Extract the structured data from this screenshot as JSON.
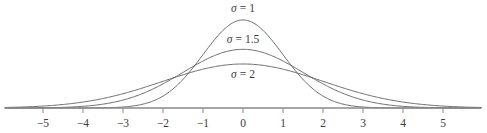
{
  "chart_data": {
    "type": "line",
    "title": "",
    "subtitle": "",
    "xlabel": "",
    "ylabel": "",
    "xlim": [
      -5.95,
      5.95
    ],
    "ylim": [
      0,
      0.4
    ],
    "grid": false,
    "legend_position": "inline-annotations",
    "x_ticks": [
      -5,
      -4,
      -3,
      -2,
      -1,
      0,
      1,
      2,
      3,
      4,
      5
    ],
    "x_tick_labels": [
      "−5",
      "−4",
      "−3",
      "−2",
      "−1",
      "0",
      "1",
      "2",
      "3",
      "4",
      "5"
    ],
    "y_ticks": [],
    "y_tick_labels": [],
    "series": [
      {
        "name": "σ = 1",
        "sigma": 1,
        "mu": 0,
        "peak_value": 0.3989,
        "annotation": {
          "symbol": "σ",
          "equals": "=",
          "value": "1",
          "x": 0,
          "y_px": 12
        },
        "x": [
          -5.95,
          -5.5,
          -5,
          -4.5,
          -4,
          -3.5,
          -3,
          -2.5,
          -2,
          -1.5,
          -1,
          -0.5,
          0,
          0.5,
          1,
          1.5,
          2,
          2.5,
          3,
          3.5,
          4,
          4.5,
          5,
          5.5,
          5.95
        ],
        "values": [
          0.0,
          0.0001,
          0.0,
          0.0,
          0.0001,
          0.0009,
          0.0044,
          0.0175,
          0.054,
          0.1295,
          0.242,
          0.3521,
          0.3989,
          0.3521,
          0.242,
          0.1295,
          0.054,
          0.0175,
          0.0044,
          0.0009,
          0.0001,
          0.0,
          0.0,
          0.0,
          0.0
        ]
      },
      {
        "name": "σ = 1.5",
        "sigma": 1.5,
        "mu": 0,
        "peak_value": 0.266,
        "annotation": {
          "symbol": "σ",
          "equals": "=",
          "value": "1.5",
          "x": 0,
          "y_px": 43
        },
        "x": [
          -5.95,
          -5.5,
          -5,
          -4.5,
          -4,
          -3.5,
          -3,
          -2.5,
          -2,
          -1.5,
          -1,
          -0.5,
          0,
          0.5,
          1,
          1.5,
          2,
          2.5,
          3,
          3.5,
          4,
          4.5,
          5,
          5.5,
          5.95
        ],
        "values": [
          0.0004,
          0.0009,
          0.0023,
          0.0051,
          0.0109,
          0.0213,
          0.0379,
          0.0615,
          0.091,
          0.1226,
          0.1506,
          0.169,
          0.266,
          0.169,
          0.1506,
          0.1226,
          0.091,
          0.0615,
          0.0379,
          0.0213,
          0.0109,
          0.0051,
          0.0023,
          0.0009,
          0.0004
        ]
      },
      {
        "name": "σ = 2",
        "sigma": 2,
        "mu": 0,
        "peak_value": 0.1995,
        "annotation": {
          "symbol": "σ",
          "equals": "=",
          "value": "2",
          "x": 0,
          "y_px": 78
        },
        "x": [
          -5.95,
          -5.5,
          -5,
          -4.5,
          -4,
          -3.5,
          -3,
          -2.5,
          -2,
          -1.5,
          -1,
          -0.5,
          0,
          0.5,
          1,
          1.5,
          2,
          2.5,
          3,
          3.5,
          4,
          4.5,
          5,
          5.5,
          5.95
        ],
        "values": [
          0.0051,
          0.0079,
          0.0088,
          0.0145,
          0.027,
          0.0417,
          0.0648,
          0.0913,
          0.121,
          0.1506,
          0.176,
          0.1933,
          0.1995,
          0.1933,
          0.176,
          0.1506,
          0.121,
          0.0913,
          0.0648,
          0.0417,
          0.027,
          0.0145,
          0.0088,
          0.0079,
          0.0051
        ]
      }
    ],
    "colors": {
      "curve": "#5a5a5a",
      "axis": "#8a8a8a",
      "text": "#3b3b3b",
      "background": "#ffffff"
    },
    "geometry": {
      "origin_x_px": 243,
      "axis_y_px": 108,
      "px_per_unit": 40,
      "axis_start_px": 5,
      "axis_end_px": 480,
      "tick_length_px": 5
    }
  }
}
